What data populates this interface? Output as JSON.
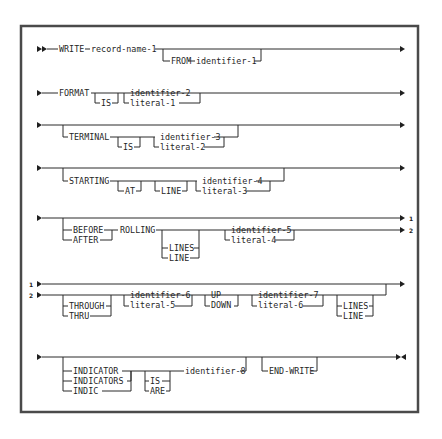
{
  "diagram": {
    "rows": {
      "r1": {
        "write": "WRITE",
        "record": "record-name-1",
        "from": "FROM",
        "ident": "identifier-1"
      },
      "r2": {
        "format": "FORMAT",
        "is": "IS",
        "ident": "identifier-2",
        "literal": "literal-1"
      },
      "r3": {
        "terminal": "TERMINAL",
        "is": "IS",
        "ident": "identifier-3",
        "literal": "literal-2"
      },
      "r4": {
        "starting": "STARTING",
        "at": "AT",
        "line": "LINE",
        "ident": "identifier-4",
        "literal": "literal-3"
      },
      "r5": {
        "before": "BEFORE",
        "after": "AFTER",
        "rolling": "ROLLING",
        "lines": "LINES",
        "line": "LINE",
        "ident": "identifier-5",
        "literal": "literal-4",
        "cont1": "1",
        "cont2": "2"
      },
      "r6": {
        "cont1": "1",
        "cont2": "2",
        "through": "THROUGH",
        "thru": "THRU",
        "ident6": "identifier-6",
        "literal5": "literal-5",
        "up": "UP",
        "down": "DOWN",
        "ident7": "identifier-7",
        "literal6": "literal-6",
        "lines": "LINES",
        "line": "LINE"
      },
      "r7": {
        "indicator": "INDICATOR",
        "indicators": "INDICATORS",
        "indic": "INDIC",
        "is": "IS",
        "are": "ARE",
        "ident": "identifier-8",
        "endwrite": "END-WRITE"
      }
    }
  }
}
